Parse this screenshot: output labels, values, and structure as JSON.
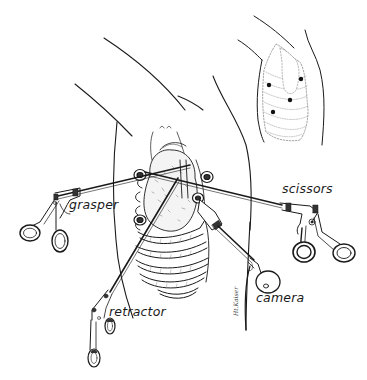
{
  "figure": {
    "inset": {
      "description": "Lateral torso view showing port placement sites",
      "port_count": 4
    },
    "labels": {
      "grasper": "grasper",
      "scissors": "scissors",
      "retractor": "retractor",
      "camera": "camera"
    },
    "signature": "Ht.Kaiser",
    "colors": {
      "ink": "#1a1a1a",
      "background": "#ffffff",
      "shade": "#777777"
    }
  }
}
